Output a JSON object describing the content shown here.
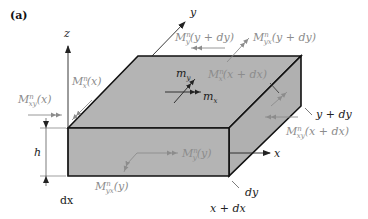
{
  "figure": {
    "panel_label": "(a)",
    "colors": {
      "face": "#b4b4b4",
      "edge": "#111111",
      "axis": "#222222",
      "moment_arrow": "#8c8c8c",
      "label_gray": "#8c8c8c",
      "label_dark": "#222222"
    },
    "axes": {
      "z": "z",
      "y": "y",
      "x": "x"
    },
    "dimensions": {
      "h": "h",
      "dx": "dx",
      "dy": "dy",
      "y_plus_dy": "y + dy",
      "x_plus_dx": "x + dx"
    },
    "moments": {
      "Mxy_x": {
        "base": "M",
        "sup": "n",
        "sub": "xy",
        "arg": "(x)"
      },
      "Mx_x": {
        "base": "M",
        "sup": "n",
        "sub": "x",
        "arg": "(x)"
      },
      "My_ydy": {
        "base": "M",
        "sup": "n",
        "sub": "y",
        "arg": "(y + dy)"
      },
      "Myx_ydy": {
        "base": "M",
        "sup": "n",
        "sub": "yx",
        "arg": "(y + dy)"
      },
      "Mx_xdx": {
        "base": "M",
        "sup": "n",
        "sub": "x",
        "arg": "(x + dx)"
      },
      "Mxy_xdx": {
        "base": "M",
        "sup": "n",
        "sub": "xy",
        "arg": "(x + dx)"
      },
      "My_y": {
        "base": "M",
        "sup": "n",
        "sub": "y",
        "arg": "(y)"
      },
      "Myx_y": {
        "base": "M",
        "sup": "n",
        "sub": "yx",
        "arg": "(y)"
      }
    },
    "distributed_moments": {
      "mx": {
        "base": "m",
        "sub": "x"
      },
      "my": {
        "base": "m",
        "sub": "y"
      }
    }
  }
}
